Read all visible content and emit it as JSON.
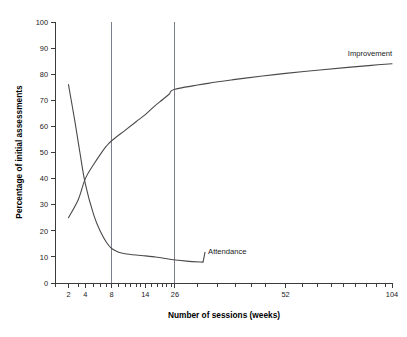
{
  "chart_data": {
    "type": "line",
    "title": "",
    "xlabel": "Number of sessions (weeks)",
    "ylabel": "Percentage of initial assessments",
    "xlim": [
      1,
      104
    ],
    "ylim": [
      0,
      100
    ],
    "grid": false,
    "legend_position": "inline-annotation",
    "x_scale": "compressed-log",
    "x_ticks": [
      2,
      4,
      8,
      14,
      26,
      52,
      104
    ],
    "x_tick_labels": [
      "2",
      "4",
      "8",
      "14",
      "26",
      "52",
      "104"
    ],
    "x_minor_ticks": [
      1,
      3,
      5,
      6,
      7,
      9,
      10,
      11,
      12,
      13,
      16,
      18,
      20,
      22,
      24,
      30,
      34,
      38,
      42,
      46,
      58,
      64,
      70,
      76,
      82,
      88,
      94,
      100
    ],
    "y_ticks": [
      0,
      10,
      20,
      30,
      40,
      50,
      60,
      70,
      80,
      90,
      100
    ],
    "y_tick_labels": [
      "0",
      "10",
      "20",
      "30",
      "40",
      "50",
      "60",
      "70",
      "80",
      "90",
      "100"
    ],
    "reference_lines": [
      {
        "name": "week-8-reference",
        "x": 8,
        "label": ""
      },
      {
        "name": "week-26-reference",
        "x": 26,
        "label": ""
      }
    ],
    "series": [
      {
        "name": "Improvement",
        "label": "Improvement",
        "label_x": 78,
        "label_y": 88,
        "x": [
          2,
          3,
          4,
          5,
          6,
          7,
          8,
          10,
          12,
          14,
          17,
          20,
          23,
          26,
          32,
          38,
          45,
          52,
          65,
          78,
          91,
          104
        ],
        "values": [
          25,
          32,
          40,
          45.5,
          49.5,
          52.5,
          54.5,
          58.5,
          61.8,
          64.5,
          67.8,
          70.2,
          72.3,
          74.2,
          76.5,
          78,
          79.3,
          80.3,
          81.6,
          82.6,
          83.4,
          84
        ]
      },
      {
        "name": "Attendance",
        "label": "Attendance",
        "label_x": 32,
        "label_y": 12,
        "x": [
          2,
          2.6,
          3.2,
          4,
          5,
          6,
          7,
          8,
          9,
          10,
          12,
          14,
          17,
          20,
          24,
          28,
          31
        ],
        "values": [
          76,
          62,
          50,
          38,
          26,
          19.5,
          15.5,
          13.2,
          11.8,
          11.2,
          10.7,
          10.4,
          10.0,
          9.6,
          9.0,
          8.4,
          8.0
        ]
      }
    ]
  }
}
